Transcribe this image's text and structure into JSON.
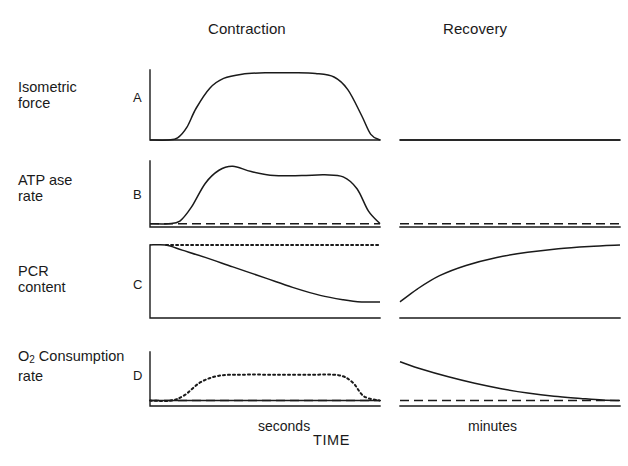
{
  "figure": {
    "phase_headers": {
      "contraction": "Contraction",
      "recovery": "Recovery"
    },
    "axis_labels": {
      "seconds": "seconds",
      "time": "TIME",
      "minutes": "minutes"
    },
    "panels": [
      {
        "letter": "A",
        "label_line1": "Isometric",
        "label_line2": "force",
        "ylabel": "Isometric force"
      },
      {
        "letter": "B",
        "label_line1": "ATP ase",
        "label_line2": "rate",
        "ylabel": "ATP ase rate"
      },
      {
        "letter": "C",
        "label_line1": "PCR",
        "label_line2": "content",
        "ylabel": "PCR content"
      },
      {
        "letter": "D",
        "label_line1_pre": "O",
        "label_line1_sub": "2",
        "label_line1_post": " Consumption",
        "label_line2": "rate",
        "ylabel": "O2 Consumption rate"
      }
    ]
  },
  "chart_data": {
    "type": "line",
    "xlabel": "TIME",
    "x_phases": [
      "Contraction (seconds)",
      "Recovery (minutes)"
    ],
    "grid": false,
    "legend": "none",
    "axis_style": "L-shaped axes per panel, no tick marks, no numeric scales",
    "stroke_color": "#1a1a1a",
    "panels": [
      {
        "letter": "A",
        "ylabel": "Isometric force",
        "ylim": [
          0,
          1
        ],
        "series": [
          {
            "name": "Isometric force (contraction)",
            "style": "solid",
            "phase": "contraction",
            "x": [
              0.0,
              0.08,
              0.12,
              0.16,
              0.2,
              0.26,
              0.32,
              0.4,
              0.5,
              0.62,
              0.72,
              0.8,
              0.86,
              0.92,
              0.96,
              1.0
            ],
            "y": [
              0.0,
              0.0,
              0.03,
              0.18,
              0.45,
              0.74,
              0.88,
              0.94,
              0.96,
              0.96,
              0.95,
              0.9,
              0.72,
              0.35,
              0.08,
              0.0
            ]
          },
          {
            "name": "Isometric force (recovery)",
            "style": "solid",
            "phase": "recovery",
            "x": [
              0.0,
              1.0
            ],
            "y": [
              0.0,
              0.0
            ]
          }
        ]
      },
      {
        "letter": "B",
        "ylabel": "ATP ase rate",
        "ylim": [
          0,
          1
        ],
        "series": [
          {
            "name": "ATPase rate (contraction)",
            "style": "solid",
            "phase": "contraction",
            "x": [
              0.0,
              0.08,
              0.13,
              0.18,
              0.24,
              0.3,
              0.36,
              0.44,
              0.54,
              0.66,
              0.76,
              0.84,
              0.9,
              0.95,
              1.0
            ],
            "y": [
              0.05,
              0.05,
              0.09,
              0.3,
              0.66,
              0.86,
              0.92,
              0.84,
              0.78,
              0.78,
              0.79,
              0.76,
              0.58,
              0.24,
              0.05
            ]
          },
          {
            "name": "Resting ATPase baseline (contraction)",
            "style": "dashed",
            "phase": "contraction",
            "x": [
              0.0,
              1.0
            ],
            "y": [
              0.05,
              0.05
            ]
          },
          {
            "name": "Resting ATPase baseline (recovery)",
            "style": "dashed",
            "phase": "recovery",
            "x": [
              0.0,
              1.0
            ],
            "y": [
              0.05,
              0.05
            ]
          }
        ]
      },
      {
        "letter": "C",
        "ylabel": "PCR content",
        "ylim": [
          0,
          1
        ],
        "series": [
          {
            "name": "PCR content (contraction)",
            "style": "solid",
            "phase": "contraction",
            "x": [
              0.0,
              0.07,
              0.14,
              0.24,
              0.36,
              0.5,
              0.62,
              0.74,
              0.84,
              0.92,
              1.0
            ],
            "y": [
              1.0,
              1.0,
              0.93,
              0.83,
              0.7,
              0.55,
              0.42,
              0.31,
              0.25,
              0.22,
              0.22
            ]
          },
          {
            "name": "Resting PCR level (contraction)",
            "style": "dotted",
            "phase": "contraction",
            "x": [
              0.07,
              1.0
            ],
            "y": [
              1.0,
              1.0
            ]
          },
          {
            "name": "PCR content (recovery)",
            "style": "solid",
            "phase": "recovery",
            "x": [
              0.0,
              0.08,
              0.18,
              0.3,
              0.44,
              0.58,
              0.72,
              0.86,
              1.0
            ],
            "y": [
              0.22,
              0.4,
              0.58,
              0.72,
              0.83,
              0.9,
              0.95,
              0.98,
              1.0
            ]
          }
        ]
      },
      {
        "letter": "D",
        "ylabel": "O2 Consumption rate",
        "ylim": [
          0,
          1
        ],
        "series": [
          {
            "name": "O2 consumption (contraction)",
            "style": "dotted",
            "phase": "contraction",
            "x": [
              0.0,
              0.09,
              0.15,
              0.22,
              0.3,
              0.4,
              0.55,
              0.7,
              0.82,
              0.88,
              0.93,
              1.0
            ],
            "y": [
              0.1,
              0.1,
              0.2,
              0.44,
              0.56,
              0.58,
              0.58,
              0.58,
              0.57,
              0.44,
              0.18,
              0.1
            ]
          },
          {
            "name": "Resting O2 baseline (contraction)",
            "style": "dashed",
            "phase": "contraction",
            "x": [
              0.0,
              1.0
            ],
            "y": [
              0.1,
              0.1
            ]
          },
          {
            "name": "Solid baseline (contraction)",
            "style": "solid",
            "phase": "contraction",
            "x": [
              0.0,
              1.0
            ],
            "y": [
              0.1,
              0.1
            ]
          },
          {
            "name": "O2 consumption (recovery)",
            "style": "solid",
            "phase": "recovery",
            "x": [
              0.0,
              0.1,
              0.22,
              0.34,
              0.46,
              0.58,
              0.7,
              0.82,
              0.92,
              1.0
            ],
            "y": [
              0.82,
              0.68,
              0.54,
              0.42,
              0.32,
              0.24,
              0.18,
              0.14,
              0.11,
              0.1
            ]
          },
          {
            "name": "Resting O2 baseline (recovery)",
            "style": "dashed",
            "phase": "recovery",
            "x": [
              0.0,
              1.0
            ],
            "y": [
              0.1,
              0.1
            ]
          }
        ]
      }
    ]
  }
}
